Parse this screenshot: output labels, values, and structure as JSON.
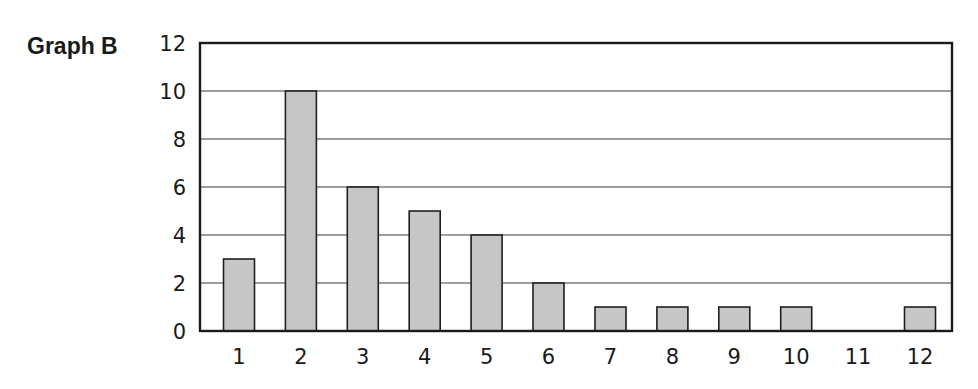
{
  "title": "Graph B",
  "colors": {
    "bar_fill": "#c6c6c6",
    "bar_stroke": "#1f1f1f",
    "grid": "#9e9e9e",
    "axis": "#1a1a1a"
  },
  "chart_data": {
    "type": "bar",
    "title": "Graph B",
    "xlabel": "",
    "ylabel": "",
    "categories": [
      "1",
      "2",
      "3",
      "4",
      "5",
      "6",
      "7",
      "8",
      "9",
      "10",
      "11",
      "12"
    ],
    "values": [
      3,
      10,
      6,
      5,
      4,
      2,
      1,
      1,
      1,
      1,
      0,
      1
    ],
    "ylim": [
      0,
      12
    ],
    "yticks": [
      0,
      2,
      4,
      6,
      8,
      10,
      12
    ],
    "grid": true,
    "grid_axis": "y",
    "legend": null
  }
}
